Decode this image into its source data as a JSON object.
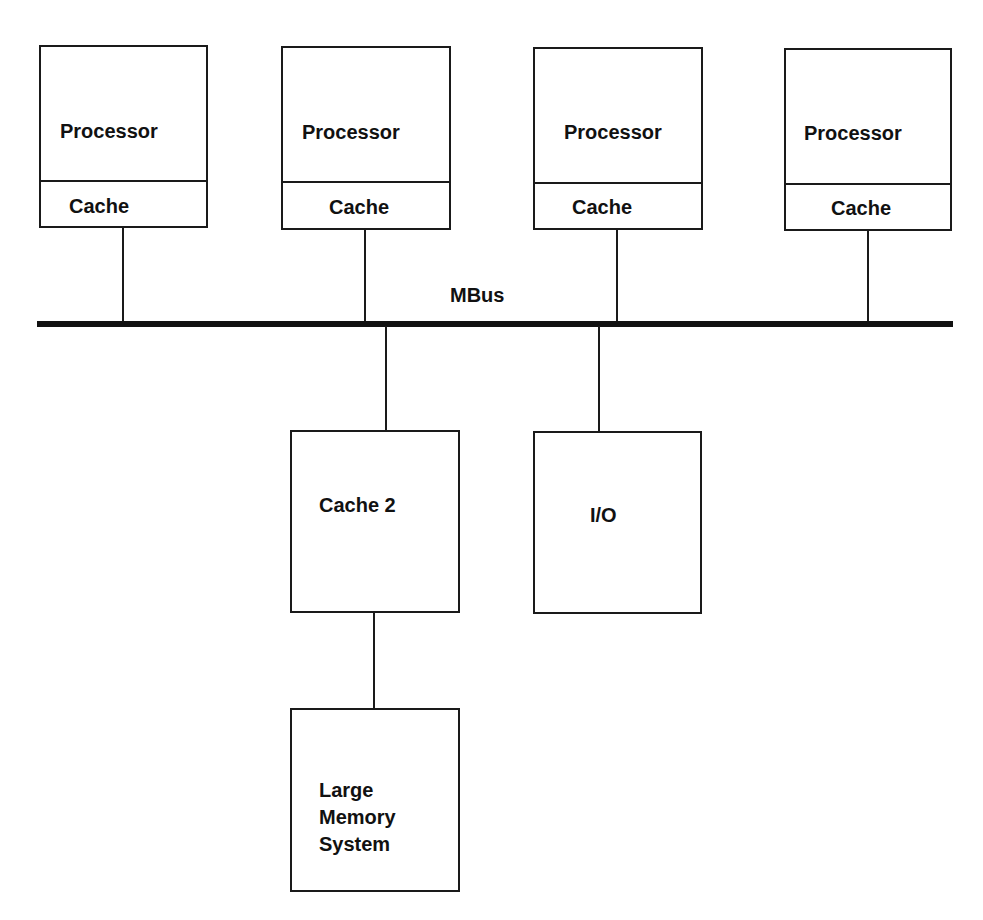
{
  "diagram": {
    "bus": {
      "label": "MBus"
    },
    "processors": [
      {
        "processor_label": "Processor",
        "cache_label": "Cache"
      },
      {
        "processor_label": "Processor",
        "cache_label": "Cache"
      },
      {
        "processor_label": "Processor",
        "cache_label": "Cache"
      },
      {
        "processor_label": "Processor",
        "cache_label": "Cache"
      }
    ],
    "cache2": {
      "label": "Cache 2"
    },
    "io": {
      "label": "I/O"
    },
    "memory": {
      "label": "Large\nMemory\nSystem"
    }
  }
}
